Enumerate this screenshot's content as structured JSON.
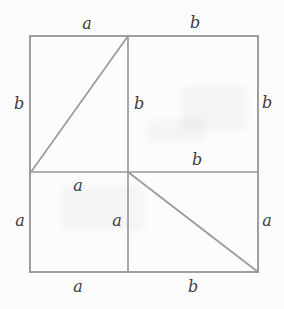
{
  "labels": {
    "top_a": "a",
    "top_b": "b",
    "left_b": "b",
    "left_a": "a",
    "right_b": "b",
    "right_a": "a",
    "bottom_a": "a",
    "bottom_b": "b",
    "inner_vertical_top_b": "b",
    "inner_horizontal_right_b": "b",
    "inner_horizontal_left_a": "a",
    "inner_vertical_bottom_a": "a"
  },
  "colors": {
    "line": "#9a9a9a",
    "text": "#3d3d3d",
    "background": "#fcfcfc"
  }
}
